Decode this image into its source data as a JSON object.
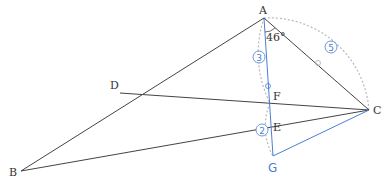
{
  "diagram": {
    "colors": {
      "black_line": "#444444",
      "blue_line": "#4a7fd0",
      "dotted_arc": "#b8b8b8",
      "marker": "#4a7fd0"
    },
    "points": {
      "A": {
        "label": "A",
        "x": 264,
        "y": 18
      },
      "B": {
        "label": "B",
        "x": 21,
        "y": 171
      },
      "C": {
        "label": "C",
        "x": 369,
        "y": 110
      },
      "D": {
        "label": "D",
        "x": 120,
        "y": 93
      },
      "E": {
        "label": "E",
        "x": 271,
        "y": 120
      },
      "F": {
        "label": "F",
        "x": 270,
        "y": 103
      },
      "G": {
        "label": "G",
        "x": 273,
        "y": 156
      }
    },
    "angle_label": "46°",
    "step_markers": [
      {
        "id": "step3",
        "label": "3",
        "x": 259,
        "y": 57
      },
      {
        "id": "step5",
        "label": "5",
        "x": 331,
        "y": 47
      },
      {
        "id": "step2",
        "label": "2",
        "x": 262,
        "y": 130
      }
    ]
  }
}
